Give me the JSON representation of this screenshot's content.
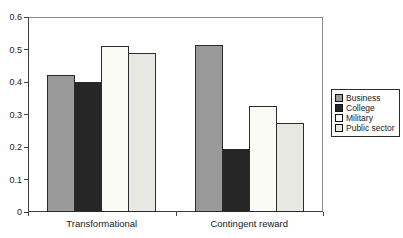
{
  "chart_data": {
    "type": "bar",
    "categories": [
      "Transformational",
      "Contingent reward"
    ],
    "series": [
      {
        "name": "Business",
        "color": "#9a9a9a",
        "values": [
          0.42,
          0.515
        ]
      },
      {
        "name": "College",
        "color": "#262626",
        "values": [
          0.4,
          0.195
        ]
      },
      {
        "name": "Military",
        "color": "#fbfbf6",
        "values": [
          0.51,
          0.325
        ]
      },
      {
        "name": "Public sector",
        "color": "#e8e8e3",
        "values": [
          0.49,
          0.275
        ]
      }
    ],
    "title": "",
    "xlabel": "",
    "ylabel": "",
    "ylim": [
      0,
      0.6
    ],
    "ytick_labels": [
      "0",
      "0.1",
      "0.2",
      "0.3",
      "0.4",
      "0.5",
      "0.6"
    ],
    "grid": false,
    "legend_position": "right",
    "legend_items": [
      "Business",
      "College",
      "Military",
      "Public sector"
    ],
    "bar_border_color": "#2b2b2b",
    "axis_color": "#3f3f3f"
  }
}
